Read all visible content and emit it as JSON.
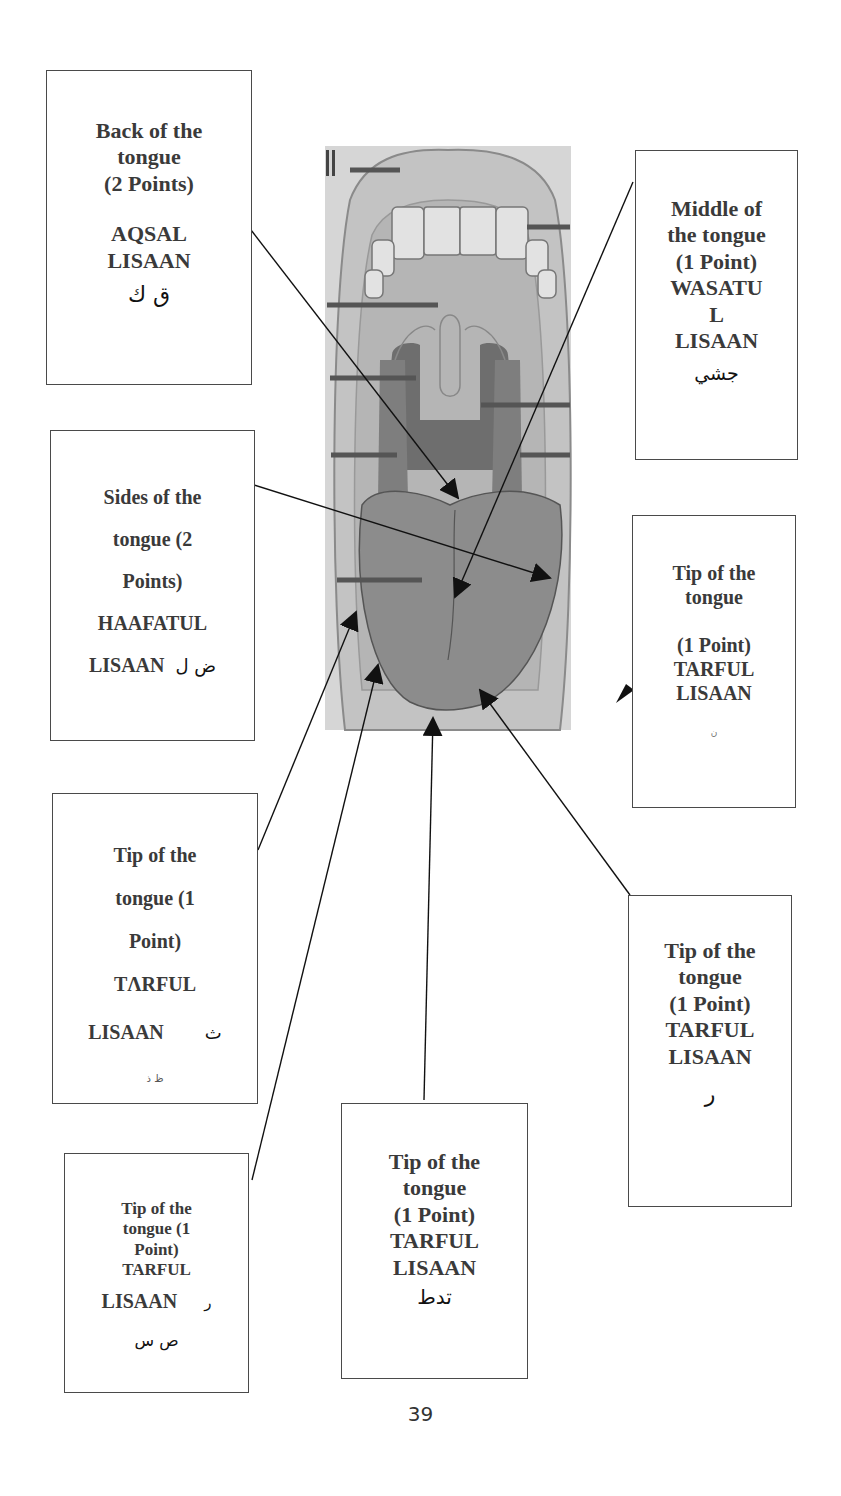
{
  "diagram": {
    "labels": {
      "back": {
        "title_lines": [
          "Back of the",
          "tongue",
          "(2 Points)"
        ],
        "term_lines": [
          "AQSAL",
          "LISAAN"
        ],
        "arabic": "ق  ك"
      },
      "middle": {
        "title_lines": [
          "Middle of",
          "the tongue",
          "(1 Point)"
        ],
        "term_lines": [
          "WASATU",
          "L",
          "LISAAN"
        ],
        "arabic": "جشي"
      },
      "sides": {
        "title_lines": [
          "Sides of the",
          "tongue (2",
          "Points)"
        ],
        "term_lines": [
          "HAAFATUL"
        ],
        "term_last": "LISAAN",
        "arabic": "ض  ل"
      },
      "tip_right_upper": {
        "title_lines": [
          "Tip of the",
          "tongue"
        ],
        "point": "(1 Point)",
        "term_lines": [
          "TARFUL",
          "LISAAN"
        ],
        "arabic": "ن"
      },
      "tip_left_mid": {
        "title_lines": [
          "Tip of the",
          "tongue (1",
          "Point)"
        ],
        "term_lines": [
          "TΛRFUL"
        ],
        "term_last": "LISAAN",
        "arabic_inline": "ث",
        "arabic": "ظ  ذ"
      },
      "tip_right_lower": {
        "title_lines": [
          "Tip of the",
          "tongue",
          "(1 Point)"
        ],
        "term_lines": [
          "TARFUL",
          "LISAAN"
        ],
        "arabic": "ر"
      },
      "tip_bottom_center": {
        "title_lines": [
          "Tip of the",
          "tongue",
          "(1 Point)"
        ],
        "term_lines": [
          "TARFUL",
          "LISAAN"
        ],
        "arabic": "تدط"
      },
      "tip_bottom_left": {
        "title_lines": [
          "Tip of the",
          "tongue (1",
          "Point)"
        ],
        "term_lines": [
          "TARFUL"
        ],
        "term_last": "LISAAN",
        "arabic_inline": "ر",
        "arabic": "ص  س"
      }
    },
    "colors": {
      "border": "#4a4a4a",
      "text": "#3a3a3a",
      "image_bg": "#d9d9d9",
      "tongue": "#8c8c8c",
      "throat": "#6e6e6e",
      "arrow": "#111111"
    }
  },
  "page": {
    "number": "39"
  }
}
